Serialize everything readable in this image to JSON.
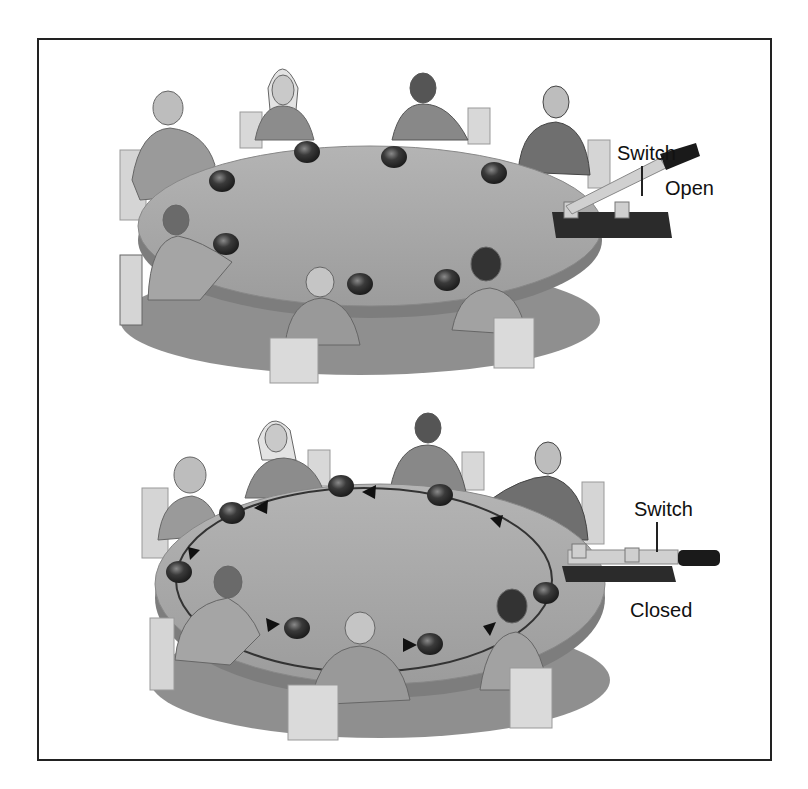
{
  "figure": {
    "panels": [
      {
        "id": "top",
        "state": "open",
        "switch_label": "Switch",
        "state_label": "Open",
        "people_count": 8,
        "ball_count": 8,
        "flow_arrows": false
      },
      {
        "id": "bottom",
        "state": "closed",
        "switch_label": "Switch",
        "state_label": "Closed",
        "people_count": 8,
        "ball_count": 8,
        "flow_arrows": true,
        "flow_direction": "counter-clockwise (viewed from above)"
      }
    ]
  },
  "colors": {
    "frame": "#222222",
    "table_top": "#a9a9a9",
    "table_edge": "#7d7d7d",
    "ball": "#3a3a3a",
    "shadow": "#5a5a5a",
    "switch_base": "#2b2b2b",
    "switch_blade": "#cfcfcf",
    "switch_handle": "#1a1a1a"
  }
}
